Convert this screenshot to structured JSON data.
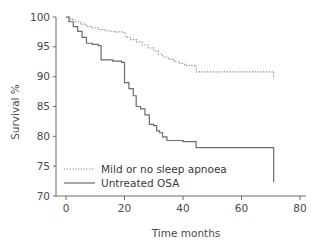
{
  "chart_data": {
    "type": "line",
    "title": "",
    "xlabel": "Time months",
    "ylabel": "Survival %",
    "xlim": [
      -4,
      80
    ],
    "ylim": [
      69,
      101
    ],
    "xticks": [
      0,
      20,
      40,
      60,
      80
    ],
    "yticks": [
      70,
      75,
      80,
      85,
      90,
      95,
      100
    ],
    "xtick_labels": [
      "0",
      "20",
      "40",
      "60",
      "80"
    ],
    "ytick_labels": [
      "70",
      "75",
      "80",
      "85",
      "90",
      "95",
      "100"
    ],
    "grid": false,
    "legend_position": "lower left inside axes",
    "step_style": "post",
    "series": [
      {
        "name": "Mild or no sleep apnoea",
        "style": "dotted",
        "color": "#808080",
        "x": [
          0,
          1.5,
          3,
          5,
          7,
          9,
          11,
          13,
          15,
          17,
          19.5,
          20.5,
          22,
          24,
          26,
          28,
          30,
          31.5,
          33,
          35,
          37,
          39,
          40.5,
          44.5,
          71,
          71
        ],
        "y": [
          100,
          99.6,
          99.2,
          98.8,
          98.4,
          98.2,
          97.9,
          97.7,
          97.6,
          97.5,
          97.4,
          96.6,
          96.2,
          95.8,
          95.3,
          94.8,
          94.3,
          93.8,
          93.3,
          92.9,
          92.5,
          92.2,
          91.9,
          90.8,
          90.8,
          89.7
        ]
      },
      {
        "name": "Untreated OSA",
        "style": "solid",
        "color": "#6b6b6b",
        "x": [
          0,
          1,
          2.5,
          4,
          5.5,
          7,
          9,
          11,
          12,
          16,
          19,
          20,
          21.5,
          23,
          24,
          25.5,
          27,
          28.5,
          30,
          31,
          32,
          33,
          34.5,
          40,
          44.5,
          71,
          71
        ],
        "y": [
          100,
          99.2,
          98.4,
          97.6,
          96.6,
          95.6,
          95.4,
          95.2,
          92.8,
          92.6,
          92.4,
          89.0,
          88.0,
          86.8,
          85.0,
          84.6,
          83.6,
          82.0,
          81.8,
          80.9,
          80.6,
          79.9,
          79.3,
          79.1,
          78.1,
          76.6,
          72.3
        ]
      }
    ]
  },
  "legend": {
    "items": [
      {
        "label": "Mild or no sleep apnoea",
        "style": "dotted"
      },
      {
        "label": "Untreated OSA",
        "style": "solid"
      }
    ]
  },
  "axes": {
    "y_title": "Survival %",
    "x_title": "Time months"
  }
}
